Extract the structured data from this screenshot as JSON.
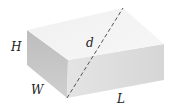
{
  "diagram": {
    "labels": {
      "height": "H",
      "width": "W",
      "length": "L",
      "diagonal": "d"
    },
    "colors": {
      "top_face": "#f2f2f2",
      "front_face": "#dcdcdc",
      "side_face": "#c4c4c4",
      "diagonal": "#555555",
      "text": "#222222"
    }
  }
}
